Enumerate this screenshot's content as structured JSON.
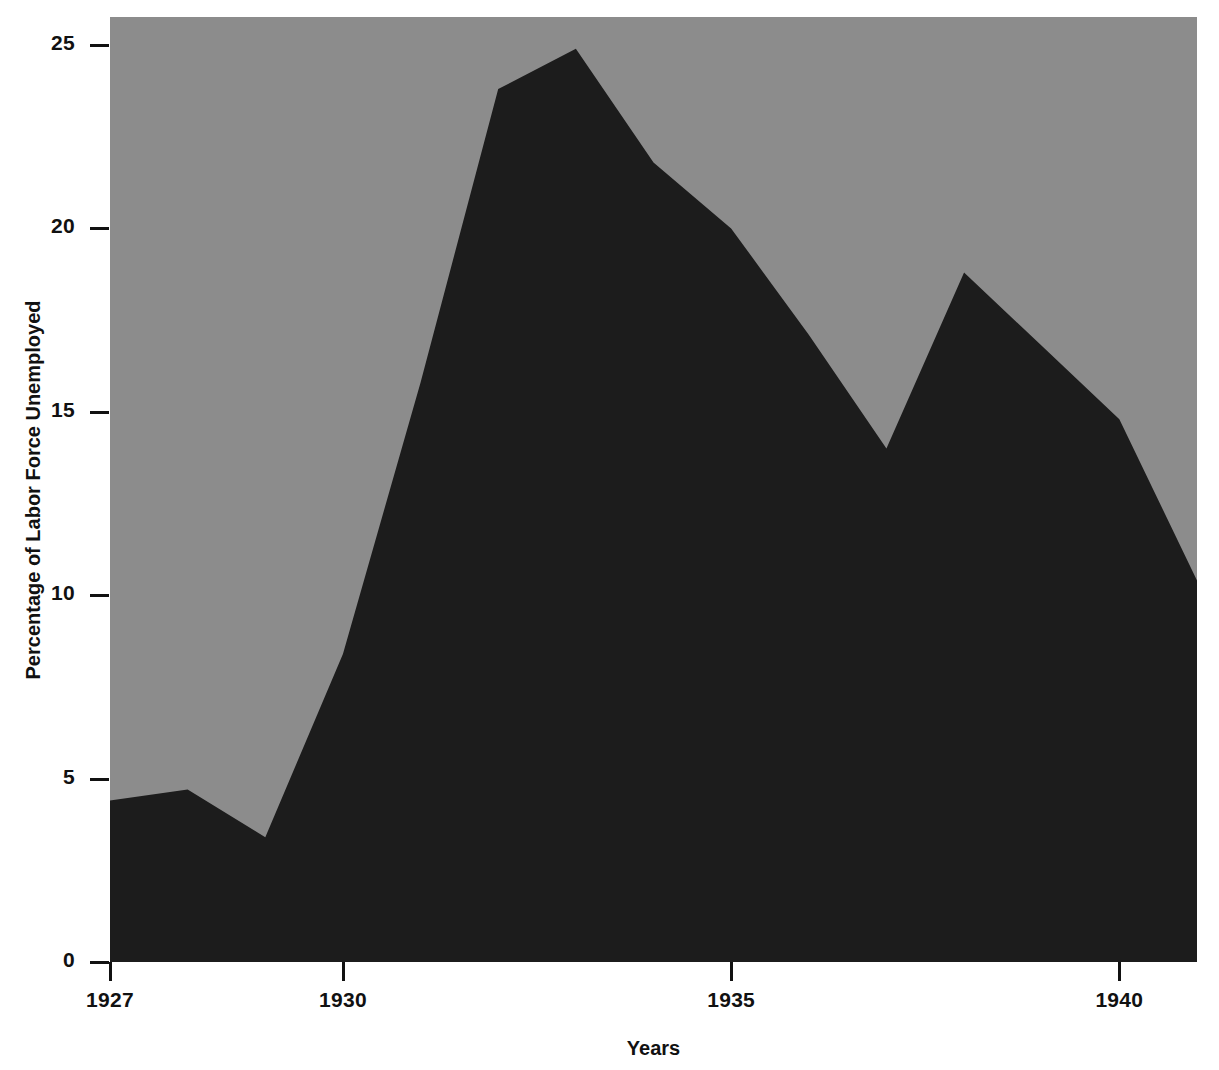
{
  "figure": {
    "background_color": "#ffffff",
    "plot_background_color": "#8c8c8c",
    "series_fill_color": "#1c1c1c",
    "axis_color": "#111111"
  },
  "axes": {
    "y_title": "Percentage of Labor Force Unemployed",
    "x_title": "Years",
    "y_ticks": [
      {
        "value": 0,
        "label": "0"
      },
      {
        "value": 5,
        "label": "5"
      },
      {
        "value": 10,
        "label": "10"
      },
      {
        "value": 15,
        "label": "15"
      },
      {
        "value": 20,
        "label": "20"
      },
      {
        "value": 25,
        "label": "25"
      }
    ],
    "x_ticks": [
      {
        "value": 1927,
        "label": "1927"
      },
      {
        "value": 1930,
        "label": "1930"
      },
      {
        "value": 1935,
        "label": "1935"
      },
      {
        "value": 1940,
        "label": "1940"
      }
    ]
  },
  "chart_data": {
    "type": "area",
    "title": "",
    "subtitle": "",
    "xlabel": "Years",
    "ylabel": "Percentage of Labor Force Unemployed",
    "xlim": [
      1927,
      1941
    ],
    "ylim": [
      0,
      26
    ],
    "grid": false,
    "legend": null,
    "x": [
      1927,
      1928,
      1929,
      1930,
      1931,
      1932,
      1933,
      1934,
      1935,
      1936,
      1937,
      1938,
      1939,
      1940,
      1941
    ],
    "values": [
      4.4,
      4.7,
      3.4,
      8.4,
      15.8,
      23.8,
      24.9,
      21.8,
      20.0,
      17.1,
      14.0,
      18.8,
      16.8,
      14.8,
      10.4
    ],
    "series": [
      {
        "name": "Percentage of Labor Force Unemployed",
        "values": [
          4.4,
          4.7,
          3.4,
          8.4,
          15.8,
          23.8,
          24.9,
          21.8,
          20.0,
          17.1,
          14.0,
          18.8,
          16.8,
          14.8,
          10.4
        ]
      }
    ]
  }
}
